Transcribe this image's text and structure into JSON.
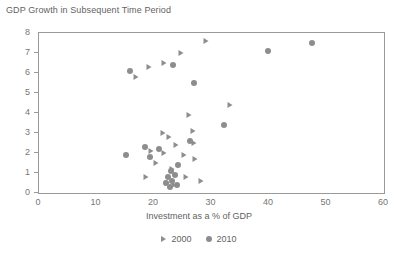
{
  "chart_data": {
    "type": "scatter",
    "title": "GDP Growth in Subsequent Time Period",
    "xlabel": "Investment as a % of GDP",
    "ylabel": "",
    "xlim": [
      0,
      60
    ],
    "ylim": [
      0,
      8
    ],
    "xticks": [
      0,
      10,
      20,
      30,
      40,
      50,
      60
    ],
    "yticks": [
      0,
      1,
      2,
      3,
      4,
      5,
      6,
      7,
      8
    ],
    "grid": false,
    "legend_position": "bottom-center",
    "marker_color": "#8d8d8d",
    "frame_color": "#9a9a9a",
    "series": [
      {
        "name": "2000",
        "marker": "triangle-right",
        "points": [
          {
            "x": 29.0,
            "y": 7.6
          },
          {
            "x": 24.7,
            "y": 7.0
          },
          {
            "x": 21.7,
            "y": 6.5
          },
          {
            "x": 19.2,
            "y": 6.3
          },
          {
            "x": 16.8,
            "y": 5.8
          },
          {
            "x": 33.3,
            "y": 4.4
          },
          {
            "x": 26.0,
            "y": 3.9
          },
          {
            "x": 26.8,
            "y": 3.1
          },
          {
            "x": 21.5,
            "y": 3.0
          },
          {
            "x": 22.6,
            "y": 2.8
          },
          {
            "x": 27.0,
            "y": 2.5
          },
          {
            "x": 23.8,
            "y": 2.4
          },
          {
            "x": 19.4,
            "y": 2.1
          },
          {
            "x": 21.8,
            "y": 2.0
          },
          {
            "x": 25.3,
            "y": 1.9
          },
          {
            "x": 27.1,
            "y": 1.7
          },
          {
            "x": 20.3,
            "y": 1.5
          },
          {
            "x": 23.1,
            "y": 1.2
          },
          {
            "x": 18.6,
            "y": 0.8
          },
          {
            "x": 25.6,
            "y": 0.8
          },
          {
            "x": 28.2,
            "y": 0.6
          },
          {
            "x": 22.2,
            "y": 0.5
          },
          {
            "x": 23.4,
            "y": 0.4
          }
        ]
      },
      {
        "name": "2010",
        "marker": "circle",
        "points": [
          {
            "x": 47.5,
            "y": 7.5
          },
          {
            "x": 39.9,
            "y": 7.1
          },
          {
            "x": 23.3,
            "y": 6.4
          },
          {
            "x": 15.9,
            "y": 6.1
          },
          {
            "x": 27.0,
            "y": 5.5
          },
          {
            "x": 32.2,
            "y": 3.4
          },
          {
            "x": 26.3,
            "y": 2.6
          },
          {
            "x": 18.5,
            "y": 2.3
          },
          {
            "x": 20.9,
            "y": 2.2
          },
          {
            "x": 15.2,
            "y": 1.9
          },
          {
            "x": 19.3,
            "y": 1.8
          },
          {
            "x": 24.1,
            "y": 1.4
          },
          {
            "x": 22.9,
            "y": 1.1
          },
          {
            "x": 23.6,
            "y": 0.9
          },
          {
            "x": 22.4,
            "y": 0.8
          },
          {
            "x": 23.2,
            "y": 0.6
          },
          {
            "x": 22.0,
            "y": 0.5
          },
          {
            "x": 24.0,
            "y": 0.4
          },
          {
            "x": 22.8,
            "y": 0.3
          }
        ]
      }
    ]
  }
}
